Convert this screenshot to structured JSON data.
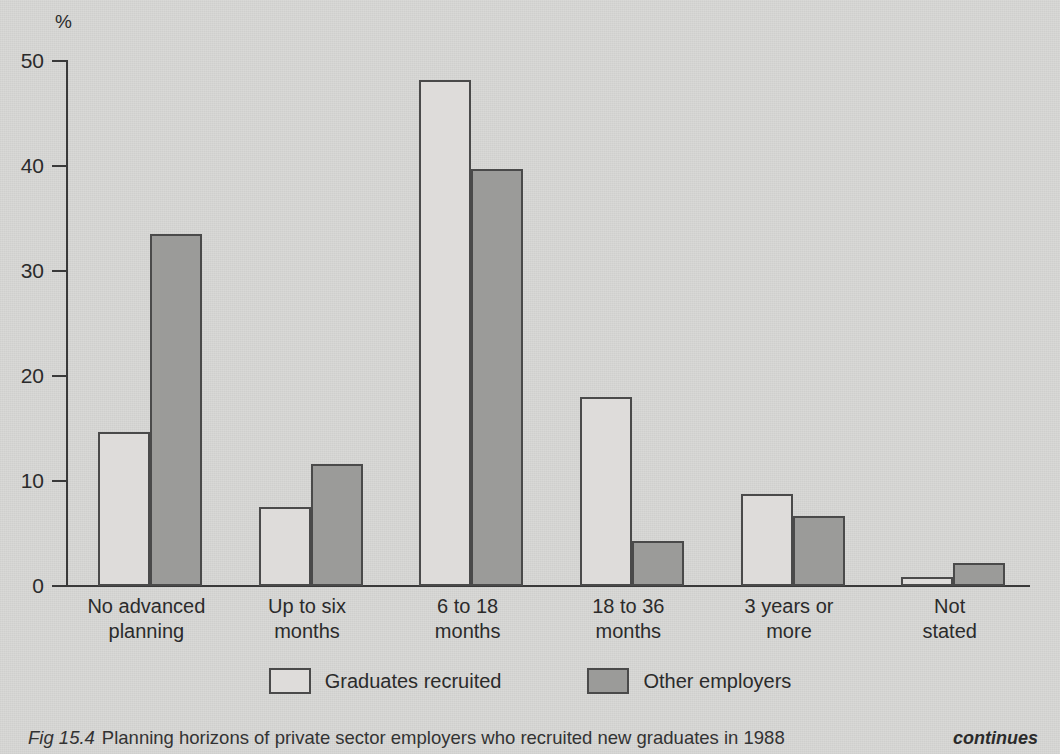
{
  "figure": {
    "caption_figure_number": "Fig 15.4",
    "caption_body": "Planning horizons of private sector employers who recruited new graduates in 1988",
    "continues_note": "continues"
  },
  "axis": {
    "y_unit_label": "%",
    "y_ticks": [
      "50",
      "40",
      "30",
      "20",
      "10",
      "0"
    ]
  },
  "legend": {
    "entries": [
      {
        "label": "Graduates recruited",
        "swatch": "white-outline-swatch",
        "color": "#dedcda"
      },
      {
        "label": "Other employers",
        "swatch": "gray-filled-swatch",
        "color": "#9b9b99"
      }
    ]
  },
  "colors": {
    "page_background": "#d8d8d6",
    "series_a_fill": "#dedcda",
    "series_b_fill": "#9b9b99",
    "ink": "#3a3a3a"
  },
  "chart_data": {
    "type": "bar",
    "title": "Planning horizons of private sector employers who recruited new graduates in 1988",
    "xlabel": "",
    "ylabel": "%",
    "ylim": [
      0,
      50
    ],
    "yticks": [
      0,
      10,
      20,
      30,
      40,
      50
    ],
    "grid": false,
    "legend_position": "bottom",
    "categories": [
      "No advanced\nplanning",
      "Up to six\nmonths",
      "6 to 18\nmonths",
      "18 to 36\nmonths",
      "3 years or\nmore",
      "Not\nstated"
    ],
    "categories_flat": [
      "No advanced planning",
      "Up to six months",
      "6 to 18 months",
      "18 to 36 months",
      "3 years or more",
      "Not stated"
    ],
    "series": [
      {
        "name": "Graduates recruited",
        "color": "#dedcda",
        "values": [
          14.7,
          7.5,
          48.2,
          18.0,
          8.8,
          0.9
        ]
      },
      {
        "name": "Other employers",
        "color": "#9b9b99",
        "values": [
          33.5,
          11.6,
          39.7,
          4.3,
          6.7,
          2.2
        ]
      }
    ]
  }
}
